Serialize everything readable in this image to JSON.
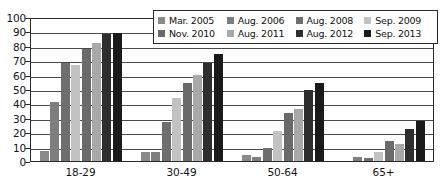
{
  "chart_data": {
    "type": "bar",
    "title": "",
    "subtitle": "",
    "xlabel": "",
    "ylabel": "",
    "ylim": [
      0,
      100
    ],
    "ytick_step": 10,
    "yticks": [
      100,
      90,
      80,
      70,
      60,
      50,
      40,
      30,
      20,
      10,
      0
    ],
    "grid": true,
    "legend_position": "top-right-inside",
    "orientation": "vertical",
    "grouping": "clustered",
    "categories": [
      "18-29",
      "30-49",
      "50-64",
      "65+"
    ],
    "series": [
      {
        "name": "Mar. 2005",
        "color": "#8a8a8a",
        "values": [
          7,
          6,
          4,
          0
        ]
      },
      {
        "name": "Aug. 2006",
        "color": "#7e7e7e",
        "values": [
          41,
          6,
          3,
          3
        ]
      },
      {
        "name": "Aug. 2008",
        "color": "#6e6e6e",
        "values": [
          68,
          27,
          9,
          2
        ]
      },
      {
        "name": "Sep. 2009",
        "color": "#c2c2c2",
        "values": [
          67,
          44,
          21,
          6
        ]
      },
      {
        "name": "Nov. 2010",
        "color": "#6a6a6a",
        "values": [
          78,
          54,
          33,
          14
        ]
      },
      {
        "name": "Aug. 2011",
        "color": "#a8a8a8",
        "values": [
          82,
          60,
          36,
          12
        ]
      },
      {
        "name": "Aug. 2012",
        "color": "#2e2e2e",
        "values": [
          88,
          68,
          49,
          22
        ]
      },
      {
        "name": "Sep. 2013",
        "color": "#1a1a1a",
        "values": [
          89,
          74,
          54,
          28
        ]
      }
    ]
  },
  "legend": {
    "items": [
      {
        "label": "Mar. 2005",
        "color": "#8a8a8a"
      },
      {
        "label": "Aug. 2006",
        "color": "#7e7e7e"
      },
      {
        "label": "Aug. 2008",
        "color": "#6e6e6e"
      },
      {
        "label": "Sep. 2009",
        "color": "#c2c2c2"
      },
      {
        "label": "Nov. 2010",
        "color": "#6a6a6a"
      },
      {
        "label": "Aug. 2011",
        "color": "#a8a8a8"
      },
      {
        "label": "Aug. 2012",
        "color": "#2e2e2e"
      },
      {
        "label": "Sep. 2013",
        "color": "#1a1a1a"
      }
    ]
  },
  "axes": {
    "y_tick_labels": [
      "100",
      "90",
      "80",
      "70",
      "60",
      "50",
      "40",
      "30",
      "20",
      "10",
      "0"
    ],
    "x_tick_labels": [
      "18-29",
      "30-49",
      "50-64",
      "65+"
    ]
  },
  "colors": {
    "axis": "#2a2a2a",
    "gridline": "#4a4a4a",
    "background": "#ffffff",
    "text": "#141414"
  }
}
